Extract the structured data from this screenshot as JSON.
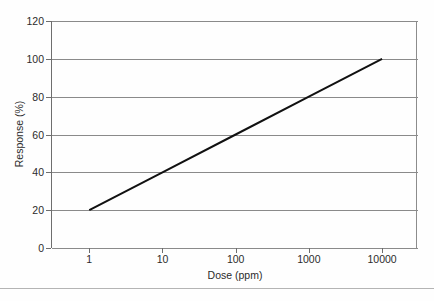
{
  "chart_data": {
    "type": "line",
    "title": "",
    "subtitle": "",
    "xlabel": "Dose (ppm)",
    "ylabel": "Response (%)",
    "x_scale": "log",
    "y_scale": "linear",
    "xlim": [
      0.3,
      30000
    ],
    "ylim": [
      0,
      120
    ],
    "grid": "horizontal",
    "legend": "none",
    "x_ticks": [
      {
        "value": 1,
        "label": "1"
      },
      {
        "value": 10,
        "label": "10"
      },
      {
        "value": 100,
        "label": "100"
      },
      {
        "value": 1000,
        "label": "1000"
      },
      {
        "value": 10000,
        "label": "10000"
      }
    ],
    "y_ticks": [
      {
        "value": 0,
        "label": "0"
      },
      {
        "value": 20,
        "label": "20"
      },
      {
        "value": 40,
        "label": "40"
      },
      {
        "value": 60,
        "label": "60"
      },
      {
        "value": 80,
        "label": "80"
      },
      {
        "value": 100,
        "label": "100"
      },
      {
        "value": 120,
        "label": "120"
      }
    ],
    "series": [
      {
        "name": "dose-response",
        "color": "#111111",
        "line_width": 2,
        "x": [
          1,
          10,
          100,
          1000,
          10000
        ],
        "y": [
          20,
          40,
          60,
          80,
          100
        ]
      }
    ],
    "annotations": []
  },
  "figure": {
    "background": "#fefefe",
    "axis_color": "#6e6e6e",
    "grid_color": "#8a8a8a",
    "text_color": "#2b2b2b",
    "footer_rule_color": "#b4b4b4"
  }
}
